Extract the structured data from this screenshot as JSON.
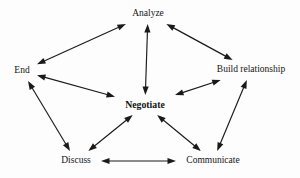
{
  "diagram": {
    "width": 300,
    "height": 178,
    "background_color": "#fdfdfd",
    "line_color": "#1a1a1a",
    "text_color": "#141414",
    "nodes": [
      {
        "id": "analyze",
        "label": "Analyze",
        "x": 148,
        "y": 14,
        "bold": false,
        "half_w": 22,
        "half_h": 7
      },
      {
        "id": "end",
        "label": "End",
        "x": 22,
        "y": 71,
        "bold": false,
        "half_w": 12,
        "half_h": 7
      },
      {
        "id": "build",
        "label": "Build relationship",
        "x": 251,
        "y": 70,
        "bold": false,
        "half_w": 45,
        "half_h": 7
      },
      {
        "id": "negotiate",
        "label": "Negotiate",
        "x": 145,
        "y": 105,
        "bold": true,
        "half_w": 27,
        "half_h": 7
      },
      {
        "id": "discuss",
        "label": "Discuss",
        "x": 76,
        "y": 161,
        "bold": false,
        "half_w": 22,
        "half_h": 7
      },
      {
        "id": "communicate",
        "label": "Communicate",
        "x": 213,
        "y": 161,
        "bold": false,
        "half_w": 34,
        "half_h": 7
      }
    ],
    "edges": [
      {
        "from": "end",
        "to": "analyze",
        "arrows": "both"
      },
      {
        "from": "analyze",
        "to": "build",
        "arrows": "both"
      },
      {
        "from": "analyze",
        "to": "negotiate",
        "arrows": "both"
      },
      {
        "from": "end",
        "to": "negotiate",
        "arrows": "both"
      },
      {
        "from": "negotiate",
        "to": "build",
        "arrows": "both"
      },
      {
        "from": "end",
        "to": "discuss",
        "arrows": "both"
      },
      {
        "from": "discuss",
        "to": "negotiate",
        "arrows": "both"
      },
      {
        "from": "negotiate",
        "to": "communicate",
        "arrows": "both"
      },
      {
        "from": "communicate",
        "to": "build",
        "arrows": "both"
      },
      {
        "from": "discuss",
        "to": "communicate",
        "arrows": "both"
      }
    ]
  }
}
